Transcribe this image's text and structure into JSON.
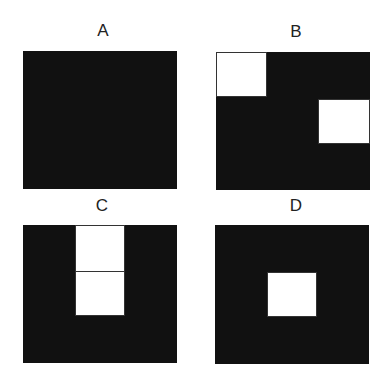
{
  "panels": [
    {
      "id": "A",
      "label": "A",
      "description": "Solid black square, no white regions"
    },
    {
      "id": "B",
      "label": "B",
      "description": "Black square with white square at top-left and white square on right middle"
    },
    {
      "id": "C",
      "label": "C",
      "description": "Black square with vertical white column at top-center divided into two squares"
    },
    {
      "id": "D",
      "label": "D",
      "description": "Black square with single white square in center"
    }
  ],
  "colors": {
    "background": "#ffffff",
    "fill": "#111111",
    "cell": "#ffffff"
  }
}
